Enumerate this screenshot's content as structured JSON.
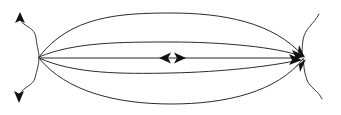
{
  "figure": {
    "title": "Converging field line diagram",
    "background_color": "#ffffff",
    "line_color": "#2b2b2b",
    "arrow_color": "#111111",
    "canvas": {
      "width": 341,
      "height": 115
    }
  },
  "chart_data": {
    "type": "diagram",
    "title": "Converging field line diagram",
    "xlabel": "",
    "ylabel": "",
    "xlim": [
      0,
      341
    ],
    "ylim": [
      0,
      115
    ],
    "grid": false,
    "legend": "none",
    "nodes": [
      {
        "name": "left-convergence-point",
        "x": 39,
        "y": 57
      },
      {
        "name": "right-convergence-point",
        "x": 303,
        "y": 57
      }
    ],
    "annotations": [
      {
        "name": "center-divergence-arrows",
        "x": 171,
        "y": 58,
        "text": ""
      }
    ],
    "series": [
      {
        "name": "arc-outer-top",
        "type": "arc",
        "points": [
          [
            39,
            57
          ],
          [
            171,
            13
          ],
          [
            303,
            57
          ]
        ],
        "apex_y": 13
      },
      {
        "name": "arc-inner-top",
        "type": "arc",
        "points": [
          [
            39,
            57
          ],
          [
            171,
            42
          ],
          [
            303,
            57
          ]
        ],
        "apex_y": 42
      },
      {
        "name": "axis-midline",
        "type": "line",
        "points": [
          [
            39,
            58
          ],
          [
            303,
            58
          ]
        ],
        "apex_y": 58
      },
      {
        "name": "arc-inner-bottom",
        "type": "arc",
        "points": [
          [
            39,
            58
          ],
          [
            171,
            73
          ],
          [
            303,
            60
          ]
        ],
        "apex_y": 73
      },
      {
        "name": "arc-outer-bottom",
        "type": "arc",
        "points": [
          [
            39,
            58
          ],
          [
            171,
            104
          ],
          [
            303,
            58
          ]
        ],
        "apex_y": 104
      },
      {
        "name": "left-separatrix-wavy",
        "type": "wavy",
        "points": [
          [
            21,
            19
          ],
          [
            39,
            57
          ],
          [
            20,
            95
          ]
        ]
      },
      {
        "name": "right-separatrix-wavy",
        "type": "wavy",
        "points": [
          [
            318,
            16
          ],
          [
            303,
            57
          ],
          [
            322,
            98
          ]
        ]
      }
    ],
    "arrows": [
      {
        "name": "arrow-up-left",
        "x": 20,
        "y": 15,
        "direction": "up"
      },
      {
        "name": "arrow-down-left",
        "x": 19,
        "y": 99,
        "direction": "down"
      },
      {
        "name": "arrow-center-left",
        "x": 163,
        "y": 58,
        "direction": "left"
      },
      {
        "name": "arrow-center-right",
        "x": 180,
        "y": 58,
        "direction": "right"
      },
      {
        "name": "arrow-right-upper",
        "x": 299,
        "y": 50,
        "direction": "down-right"
      },
      {
        "name": "arrow-right-mid-a",
        "x": 299,
        "y": 56,
        "direction": "right"
      },
      {
        "name": "arrow-right-mid-b",
        "x": 296,
        "y": 60,
        "direction": "right"
      },
      {
        "name": "arrow-right-lower",
        "x": 301,
        "y": 66,
        "direction": "up-right"
      }
    ]
  }
}
